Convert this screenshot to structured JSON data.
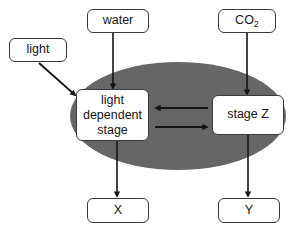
{
  "diagram": {
    "canvas": {
      "width": 301,
      "height": 233,
      "background": "#ffffff"
    },
    "colors": {
      "ellipse_fill": "#666666",
      "box_fill": "#ffffff",
      "box_border": "#3a3a3a",
      "arrow": "#141414",
      "text": "#151515"
    },
    "ellipse": {
      "name": "chloroplast-ellipse",
      "cx": 178,
      "cy": 116,
      "rx": 108,
      "ry": 54,
      "fill": "#666666"
    },
    "nodes": {
      "water": {
        "label": "water"
      },
      "co2": {
        "label": "CO2",
        "base": "CO",
        "subscript": "2"
      },
      "light": {
        "label": "light"
      },
      "light_dependent_stage": {
        "label": "light\ndependent\nstage"
      },
      "stage_z": {
        "label": "stage Z"
      },
      "x": {
        "label": "X"
      },
      "y": {
        "label": "Y"
      }
    },
    "arrows": [
      {
        "name": "arrow-water-to-light-dependent-stage",
        "from": "water",
        "to": "light dependent stage",
        "direction": "down"
      },
      {
        "name": "arrow-co2-to-stage-z",
        "from": "CO2",
        "to": "stage Z",
        "direction": "down"
      },
      {
        "name": "arrow-light-to-light-dependent-stage",
        "from": "light",
        "to": "light dependent stage",
        "direction": "diagonal-down-right"
      },
      {
        "name": "arrow-stage-z-to-light-dependent-stage",
        "from": "stage Z",
        "to": "light dependent stage",
        "direction": "left"
      },
      {
        "name": "arrow-light-dependent-stage-to-stage-z",
        "from": "light dependent stage",
        "to": "stage Z",
        "direction": "right"
      },
      {
        "name": "arrow-light-dependent-stage-to-x",
        "from": "light dependent stage",
        "to": "X",
        "direction": "down"
      },
      {
        "name": "arrow-stage-z-to-y",
        "from": "stage Z",
        "to": "Y",
        "direction": "down"
      }
    ]
  }
}
